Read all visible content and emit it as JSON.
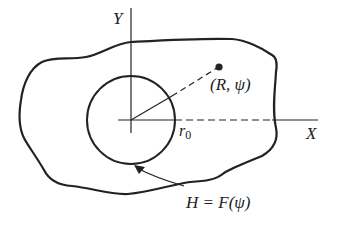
{
  "diagram": {
    "labels": {
      "y_axis": "Y",
      "x_axis": "X",
      "point": "(R, ψ)",
      "radius": "r",
      "radius_subscript": "0",
      "contour": "H = F(ψ)"
    },
    "colors": {
      "stroke": "#222222",
      "background": "#ffffff"
    }
  }
}
